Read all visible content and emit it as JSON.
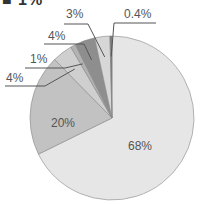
{
  "title": "■ 1%",
  "chart_data": {
    "type": "pie",
    "title": "",
    "categories": [
      "A",
      "B",
      "C",
      "D",
      "E",
      "F",
      "G"
    ],
    "values": [
      68,
      20,
      4,
      1,
      4,
      3,
      0.4
    ],
    "labels": [
      "68%",
      "20%",
      "4%",
      "1%",
      "4%",
      "3%",
      "0.4%"
    ],
    "colors": [
      "#e6e6e6",
      "#c2c2c2",
      "#cfcfcf",
      "#b3b3b3",
      "#8e8e8e",
      "#d7d7d7",
      "#777777"
    ],
    "legend": "none"
  }
}
